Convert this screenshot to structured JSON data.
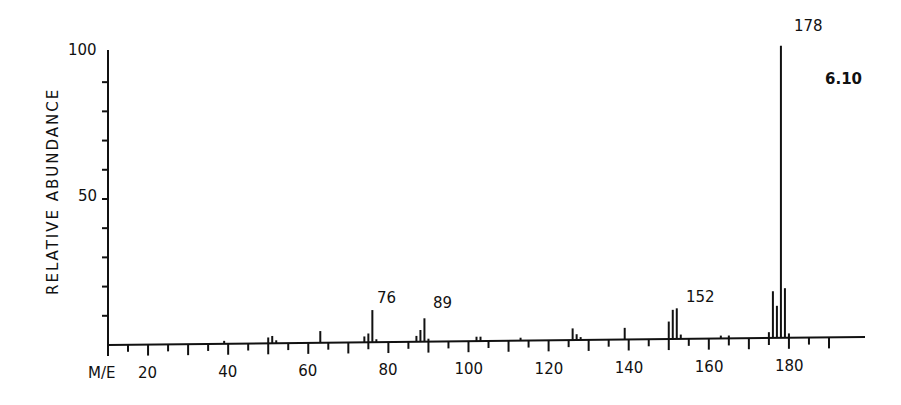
{
  "chart_data": {
    "type": "bar",
    "title": "",
    "xlabel": "M/E",
    "ylabel": "RELATIVE ABUNDANCE",
    "xlim": [
      10,
      193
    ],
    "ylim": [
      0,
      100
    ],
    "x_ticks": [
      20,
      40,
      60,
      80,
      100,
      120,
      140,
      160,
      180
    ],
    "y_ticks": [
      50,
      100
    ],
    "grid": false,
    "legend": null,
    "annotation": "6.10",
    "peak_labels": [
      76,
      89,
      152,
      178
    ],
    "x": [
      39,
      50,
      51,
      52,
      63,
      74,
      75,
      76,
      77,
      87,
      88,
      89,
      90,
      102,
      103,
      113,
      126,
      127,
      128,
      139,
      150,
      151,
      152,
      153,
      163,
      165,
      175,
      176,
      177,
      178,
      179,
      180
    ],
    "values": [
      1,
      2,
      2.5,
      1,
      4,
      2,
      3,
      11,
      1,
      2,
      4,
      8,
      1,
      1.5,
      1.5,
      1,
      4,
      2,
      1,
      4,
      6,
      10,
      10.5,
      1.5,
      1,
      1,
      2,
      16,
      11,
      100,
      17,
      1.5
    ]
  },
  "labels": {
    "y_axis_title": "RELATIVE ABUNDANCE",
    "x_axis_prefix": "M/E",
    "y_tick_100": "100",
    "y_tick_50": "50",
    "annotation": "6.10",
    "peak_76": "76",
    "peak_89": "89",
    "peak_152": "152",
    "peak_178": "178"
  }
}
